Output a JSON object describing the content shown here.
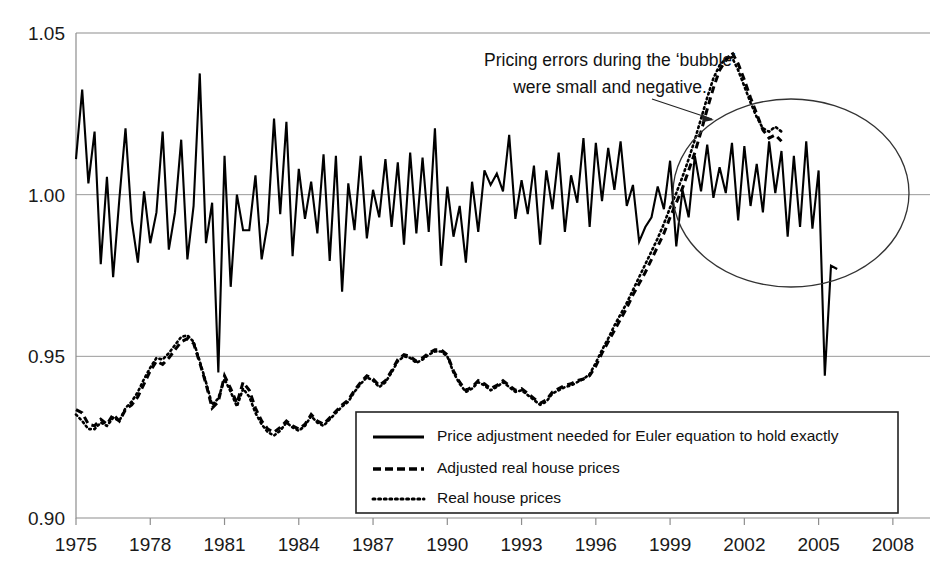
{
  "chart_data": {
    "type": "line",
    "title": "",
    "xlabel": "",
    "ylabel": "",
    "xlim": [
      1975,
      2009.5
    ],
    "ylim": [
      0.9,
      1.05
    ],
    "grid": true,
    "y_ticks": [
      "1.05",
      "1.00",
      "0.95",
      "0.90"
    ],
    "y_tick_values": [
      1.05,
      1.0,
      0.95,
      0.9
    ],
    "x_ticks": [
      "1975",
      "1978",
      "1981",
      "1984",
      "1987",
      "1990",
      "1993",
      "1996",
      "1999",
      "2002",
      "2005",
      "2008"
    ],
    "x_tick_values": [
      1975,
      1978,
      1981,
      1984,
      1987,
      1990,
      1993,
      1996,
      1999,
      2002,
      2005,
      2008
    ],
    "legend_position": "bottom-right",
    "annotations": [
      {
        "name": "bubble-note",
        "line1": "Pricing errors during the ‘bubble’",
        "line2": "were small and negative.",
        "target": "ellipse around 2000-2008 solid series"
      }
    ],
    "series": [
      {
        "name": "Price adjustment needed for Euler equation to hold exactly",
        "style": "solid",
        "x_start": 1975.0,
        "x_step": 0.25,
        "values": [
          1.011,
          1.0325,
          1.0035,
          1.0195,
          0.9785,
          1.0055,
          0.9745,
          0.9985,
          1.0205,
          0.992,
          0.979,
          1.001,
          0.985,
          0.9945,
          1.0195,
          0.983,
          0.9945,
          1.017,
          0.98,
          0.9965,
          1.0375,
          0.985,
          0.9975,
          0.945,
          1.012,
          0.9715,
          1.0,
          0.989,
          0.989,
          1.006,
          0.98,
          0.9915,
          1.0235,
          0.994,
          1.0225,
          0.981,
          1.008,
          0.9925,
          1.004,
          0.988,
          1.0125,
          0.9795,
          1.012,
          0.97,
          1.0035,
          0.989,
          1.012,
          0.9865,
          1.0015,
          0.993,
          1.011,
          0.99,
          1.01,
          0.9845,
          1.013,
          0.988,
          1.0115,
          0.9885,
          1.0205,
          0.978,
          1.0025,
          0.987,
          0.9965,
          0.979,
          1.004,
          0.9885,
          1.0075,
          1.003,
          1.0065,
          1.001,
          1.0185,
          0.9925,
          1.0045,
          0.994,
          1.009,
          0.9845,
          1.0075,
          0.9955,
          1.013,
          0.9885,
          1.006,
          0.9975,
          1.0175,
          0.99,
          1.016,
          0.998,
          1.0145,
          1.0015,
          1.0165,
          0.9965,
          1.003,
          0.9855,
          0.99,
          0.993,
          1.0025,
          0.9955,
          1.0105,
          0.984,
          1.0015,
          0.993,
          1.012,
          1.001,
          1.0155,
          0.999,
          1.0085,
          1.0005,
          1.016,
          0.992,
          1.015,
          0.9965,
          1.0095,
          0.9945,
          1.0165,
          1.0005,
          1.0135,
          0.987,
          1.012,
          0.99,
          1.0165,
          0.9895,
          1.0075,
          0.944,
          0.978,
          0.977
        ]
      },
      {
        "name": "Adjusted real house prices",
        "style": "dashed",
        "x_start": 1975.0,
        "x_step": 0.25,
        "values": [
          0.9335,
          0.9325,
          0.929,
          0.9285,
          0.9305,
          0.929,
          0.932,
          0.93,
          0.9335,
          0.935,
          0.9375,
          0.9415,
          0.9455,
          0.9485,
          0.9475,
          0.9495,
          0.952,
          0.9545,
          0.9555,
          0.954,
          0.948,
          0.9415,
          0.934,
          0.936,
          0.944,
          0.94,
          0.9355,
          0.942,
          0.9395,
          0.934,
          0.93,
          0.9275,
          0.9265,
          0.928,
          0.93,
          0.9285,
          0.9275,
          0.929,
          0.932,
          0.93,
          0.929,
          0.931,
          0.933,
          0.935,
          0.9365,
          0.9395,
          0.942,
          0.944,
          0.943,
          0.941,
          0.9425,
          0.9455,
          0.949,
          0.9505,
          0.95,
          0.9485,
          0.9495,
          0.951,
          0.952,
          0.952,
          0.9505,
          0.9455,
          0.942,
          0.9395,
          0.9405,
          0.9425,
          0.9415,
          0.94,
          0.941,
          0.9425,
          0.941,
          0.9395,
          0.94,
          0.9385,
          0.937,
          0.9355,
          0.9365,
          0.939,
          0.94,
          0.941,
          0.9415,
          0.9425,
          0.943,
          0.944,
          0.947,
          0.951,
          0.9545,
          0.958,
          0.9615,
          0.965,
          0.969,
          0.9725,
          0.976,
          0.98,
          0.984,
          0.988,
          0.993,
          0.9975,
          1.002,
          1.0075,
          1.013,
          1.0195,
          1.0265,
          1.033,
          1.0385,
          1.0415,
          1.044,
          1.0405,
          1.0355,
          1.03,
          1.025,
          1.02,
          1.0175,
          1.0185,
          1.0165
        ]
      },
      {
        "name": "Real house prices",
        "style": "dotted",
        "x_start": 1975.0,
        "x_step": 0.25,
        "values": [
          0.932,
          0.93,
          0.9275,
          0.9275,
          0.9295,
          0.9285,
          0.931,
          0.93,
          0.934,
          0.936,
          0.939,
          0.943,
          0.9465,
          0.9495,
          0.949,
          0.951,
          0.9535,
          0.956,
          0.9565,
          0.9545,
          0.9485,
          0.942,
          0.935,
          0.937,
          0.943,
          0.939,
          0.9345,
          0.94,
          0.9375,
          0.9325,
          0.929,
          0.9265,
          0.9255,
          0.927,
          0.9295,
          0.928,
          0.927,
          0.9285,
          0.9315,
          0.9295,
          0.9285,
          0.9305,
          0.9325,
          0.9345,
          0.936,
          0.939,
          0.9415,
          0.9435,
          0.9425,
          0.9405,
          0.942,
          0.945,
          0.9485,
          0.95,
          0.9495,
          0.948,
          0.949,
          0.9505,
          0.9515,
          0.9515,
          0.95,
          0.945,
          0.9415,
          0.939,
          0.94,
          0.942,
          0.941,
          0.9395,
          0.9405,
          0.942,
          0.9405,
          0.939,
          0.9395,
          0.938,
          0.9365,
          0.935,
          0.936,
          0.9385,
          0.9395,
          0.9405,
          0.941,
          0.942,
          0.943,
          0.9445,
          0.948,
          0.952,
          0.9555,
          0.9595,
          0.963,
          0.9665,
          0.9705,
          0.9745,
          0.9785,
          0.9825,
          0.9865,
          0.991,
          0.996,
          1.0005,
          1.0055,
          1.011,
          1.017,
          1.0235,
          1.03,
          1.036,
          1.04,
          1.042,
          1.0425,
          1.0385,
          1.0335,
          1.0285,
          1.024,
          1.0205,
          1.0195,
          1.021,
          1.0195
        ]
      }
    ]
  },
  "axes": {
    "y_ticks": [
      {
        "label": "1.05",
        "value": 1.05
      },
      {
        "label": "1.00",
        "value": 1.0
      },
      {
        "label": "0.95",
        "value": 0.95
      },
      {
        "label": "0.90",
        "value": 0.9
      }
    ],
    "x_ticks": [
      {
        "label": "1975",
        "value": 1975
      },
      {
        "label": "1978",
        "value": 1978
      },
      {
        "label": "1981",
        "value": 1981
      },
      {
        "label": "1984",
        "value": 1984
      },
      {
        "label": "1987",
        "value": 1987
      },
      {
        "label": "1990",
        "value": 1990
      },
      {
        "label": "1993",
        "value": 1993
      },
      {
        "label": "1996",
        "value": 1996
      },
      {
        "label": "1999",
        "value": 1999
      },
      {
        "label": "2002",
        "value": 2002
      },
      {
        "label": "2005",
        "value": 2005
      },
      {
        "label": "2008",
        "value": 2008
      }
    ]
  },
  "annotation": {
    "line1": "Pricing errors during the ‘bubble’",
    "line2": "were small and negative."
  },
  "legend": {
    "items": [
      {
        "label": "Price adjustment needed for Euler equation to hold exactly",
        "style": "solid"
      },
      {
        "label": "Adjusted real house prices",
        "style": "dashed"
      },
      {
        "label": "Real house prices",
        "style": "dotted"
      }
    ]
  },
  "colors": {
    "series": "#000000",
    "grid": "#9a9a9a",
    "axis": "#8e8e8e",
    "text": "#111111",
    "background": "#ffffff"
  }
}
